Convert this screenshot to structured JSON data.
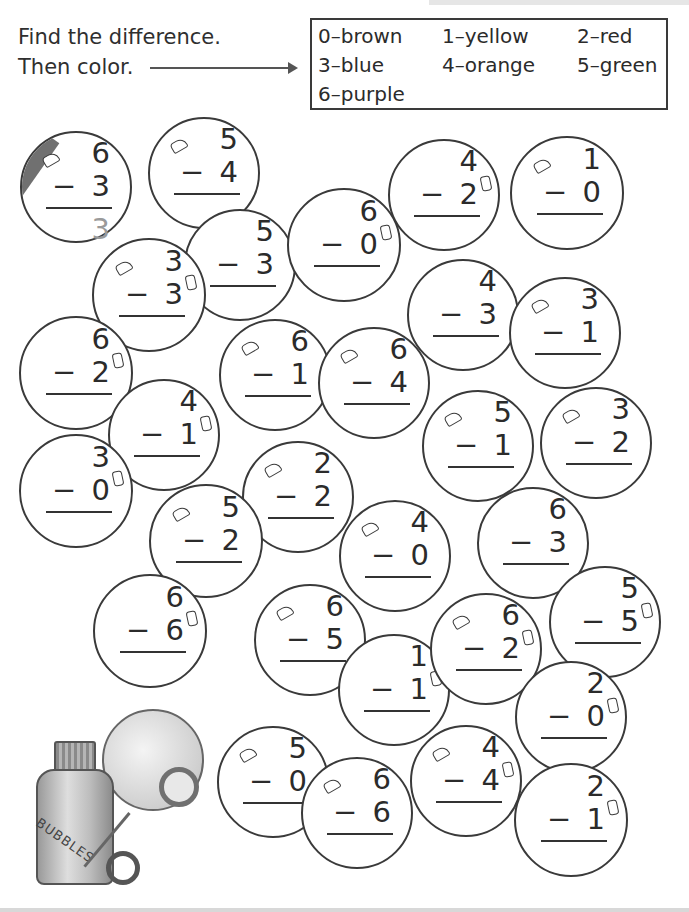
{
  "instructions": {
    "line1": "Find the difference.",
    "line2": "Then color."
  },
  "color_key": {
    "rows": [
      [
        {
          "label": "0–brown"
        },
        {
          "label": "1–yellow"
        },
        {
          "label": "2–red"
        }
      ],
      [
        {
          "label": "3–blue"
        },
        {
          "label": "4–orange"
        },
        {
          "label": "5–green"
        }
      ],
      [
        {
          "label": "6–purple"
        }
      ]
    ],
    "colors": {
      "0": "#8B5A2B",
      "1": "#F2D21B",
      "2": "#D62828",
      "3": "#2A62C9",
      "4": "#F28C28",
      "5": "#2E9E44",
      "6": "#7B3FA0"
    }
  },
  "bubbles": [
    {
      "top": "6",
      "bottom": "3",
      "minus": "−",
      "answer": "3",
      "cx": 76,
      "cy": 187,
      "r": 56,
      "colored": true,
      "shine": "left"
    },
    {
      "top": "5",
      "bottom": "4",
      "minus": "−",
      "cx": 204,
      "cy": 173,
      "r": 56,
      "shine": "left"
    },
    {
      "top": "5",
      "bottom": "3",
      "minus": "−",
      "cx": 240,
      "cy": 265,
      "r": 56
    },
    {
      "top": "3",
      "bottom": "3",
      "minus": "−",
      "cx": 149,
      "cy": 295,
      "r": 57,
      "shine": "both"
    },
    {
      "top": "6",
      "bottom": "0",
      "minus": "−",
      "cx": 344,
      "cy": 245,
      "r": 57,
      "shine": "right"
    },
    {
      "top": "4",
      "bottom": "2",
      "minus": "−",
      "cx": 444,
      "cy": 195,
      "r": 56,
      "shine": "right"
    },
    {
      "top": "1",
      "bottom": "0",
      "minus": "−",
      "cx": 567,
      "cy": 193,
      "r": 57,
      "shine": "left"
    },
    {
      "top": "4",
      "bottom": "3",
      "minus": "−",
      "cx": 463,
      "cy": 315,
      "r": 56
    },
    {
      "top": "3",
      "bottom": "1",
      "minus": "−",
      "cx": 565,
      "cy": 333,
      "r": 56,
      "shine": "left"
    },
    {
      "top": "6",
      "bottom": "2",
      "minus": "−",
      "cx": 76,
      "cy": 373,
      "r": 57,
      "shine": "right"
    },
    {
      "top": "6",
      "bottom": "1",
      "minus": "−",
      "cx": 275,
      "cy": 375,
      "r": 56,
      "shine": "left"
    },
    {
      "top": "6",
      "bottom": "4",
      "minus": "−",
      "cx": 374,
      "cy": 383,
      "r": 56,
      "shine": "left"
    },
    {
      "top": "4",
      "bottom": "1",
      "minus": "−",
      "cx": 164,
      "cy": 435,
      "r": 56,
      "shine": "right"
    },
    {
      "top": "3",
      "bottom": "0",
      "minus": "−",
      "cx": 76,
      "cy": 491,
      "r": 57,
      "shine": "right"
    },
    {
      "top": "5",
      "bottom": "1",
      "minus": "−",
      "cx": 478,
      "cy": 446,
      "r": 56,
      "shine": "left"
    },
    {
      "top": "3",
      "bottom": "2",
      "minus": "−",
      "cx": 596,
      "cy": 443,
      "r": 56,
      "shine": "left"
    },
    {
      "top": "2",
      "bottom": "2",
      "minus": "−",
      "cx": 298,
      "cy": 497,
      "r": 56,
      "shine": "left"
    },
    {
      "top": "5",
      "bottom": "2",
      "minus": "−",
      "cx": 206,
      "cy": 541,
      "r": 57,
      "shine": "left"
    },
    {
      "top": "4",
      "bottom": "0",
      "minus": "−",
      "cx": 395,
      "cy": 556,
      "r": 56,
      "shine": "left"
    },
    {
      "top": "6",
      "bottom": "3",
      "minus": "−",
      "cx": 533,
      "cy": 543,
      "r": 56
    },
    {
      "top": "6",
      "bottom": "6",
      "minus": "−",
      "cx": 150,
      "cy": 631,
      "r": 57,
      "shine": "right"
    },
    {
      "top": "6",
      "bottom": "5",
      "minus": "−",
      "cx": 310,
      "cy": 640,
      "r": 56,
      "shine": "left"
    },
    {
      "top": "1",
      "bottom": "1",
      "minus": "−",
      "cx": 394,
      "cy": 690,
      "r": 56,
      "shine": "right"
    },
    {
      "top": "6",
      "bottom": "2",
      "minus": "−",
      "cx": 486,
      "cy": 649,
      "r": 56,
      "shine": "both"
    },
    {
      "top": "5",
      "bottom": "5",
      "minus": "−",
      "cx": 605,
      "cy": 622,
      "r": 56,
      "shine": "right"
    },
    {
      "top": "2",
      "bottom": "0",
      "minus": "−",
      "cx": 571,
      "cy": 717,
      "r": 56,
      "shine": "right"
    },
    {
      "top": "5",
      "bottom": "0",
      "minus": "−",
      "cx": 273,
      "cy": 782,
      "r": 56,
      "shine": "left"
    },
    {
      "top": "6",
      "bottom": "6",
      "minus": "−",
      "cx": 357,
      "cy": 813,
      "r": 56,
      "shine": "left"
    },
    {
      "top": "4",
      "bottom": "4",
      "minus": "−",
      "cx": 466,
      "cy": 781,
      "r": 56,
      "shine": "both"
    },
    {
      "top": "2",
      "bottom": "1",
      "minus": "−",
      "cx": 571,
      "cy": 820,
      "r": 57,
      "shine": "right"
    }
  ],
  "illustration": {
    "bottle_label": "BUBBLES"
  }
}
